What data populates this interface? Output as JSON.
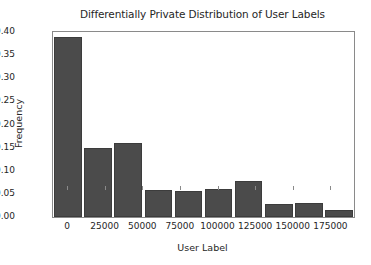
{
  "chart_data": {
    "type": "bar",
    "title": "Differentially Private Distribution of User Labels",
    "xlabel": "User Label",
    "ylabel": "Frequency",
    "categories": [
      0,
      20000,
      40000,
      60000,
      80000,
      100000,
      120000,
      140000,
      160000,
      180000
    ],
    "xtick_labels": [
      "0",
      "25000",
      "50000",
      "75000",
      "100000",
      "125000",
      "150000",
      "175000"
    ],
    "xtick_values": [
      0,
      25000,
      50000,
      75000,
      100000,
      125000,
      150000,
      175000
    ],
    "ytick_labels": [
      "0.00",
      "0.05",
      "0.10",
      "0.15",
      "0.20",
      "0.25",
      "0.30",
      "0.35",
      "0.40"
    ],
    "ytick_values": [
      0.0,
      0.05,
      0.1,
      0.15,
      0.2,
      0.25,
      0.3,
      0.35,
      0.4
    ],
    "values": [
      0.39,
      0.149,
      0.159,
      0.058,
      0.056,
      0.06,
      0.078,
      0.028,
      0.031,
      0.015
    ],
    "xlim": [
      -10000,
      190000
    ],
    "ylim": [
      0.0,
      0.4
    ],
    "grid": false,
    "legend": false,
    "bar_color": "#4b4b4b",
    "bar_edge_color": "#3c3c3c",
    "frame_color": "#8a8a8a",
    "background": "#ffffff"
  }
}
